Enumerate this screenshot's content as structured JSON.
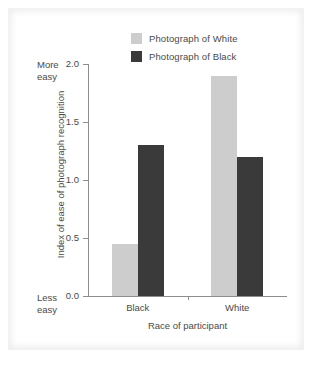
{
  "chart_data": {
    "type": "bar",
    "title": "",
    "xlabel": "Race of participant",
    "ylabel": "Index of ease of photograph recognition",
    "categories": [
      "Black",
      "White"
    ],
    "series": [
      {
        "name": "Photograph of White",
        "color": "#cdcdcd",
        "values": [
          0.45,
          1.9
        ]
      },
      {
        "name": "Photograph of Black",
        "color": "#3a3a3a",
        "values": [
          1.3,
          1.2
        ]
      }
    ],
    "ylim": [
      0.0,
      2.0
    ],
    "yticks": [
      "0.0",
      "0.5",
      "1.0",
      "1.5",
      "2.0"
    ],
    "ytick_values": [
      0.0,
      0.5,
      1.0,
      1.5,
      2.0
    ],
    "grid": false,
    "legend_position": "top-center",
    "axis_notes": {
      "top": "More\neasy",
      "top_line1": "More",
      "top_line2": "easy",
      "bottom": "Less\neasy",
      "bottom_line1": "Less",
      "bottom_line2": "easy"
    }
  },
  "legend": {
    "items": [
      {
        "label": "Photograph of White",
        "color": "#cdcdcd"
      },
      {
        "label": "Photograph of Black",
        "color": "#3a3a3a"
      }
    ]
  },
  "axis": {
    "y_title": "Index of ease of photograph recognition",
    "x_title": "Race of participant",
    "y_ticks": [
      "2.0",
      "1.5",
      "1.0",
      "0.5",
      "0.0"
    ],
    "x_categories": [
      "Black",
      "White"
    ],
    "note_more_1": "More",
    "note_more_2": "easy",
    "note_less_1": "Less",
    "note_less_2": "easy"
  },
  "colors": {
    "light_bar": "#cdcdcd",
    "dark_bar": "#3a3a3a",
    "axis": "#8d8d8d",
    "text": "#4a4a4a",
    "background": "#ffffff"
  }
}
